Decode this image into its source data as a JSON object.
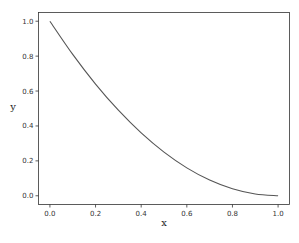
{
  "chart_data": {
    "type": "line",
    "title": "",
    "xlabel": "x",
    "ylabel": "y",
    "xlim": [
      -0.05,
      1.05
    ],
    "ylim": [
      -0.05,
      1.05
    ],
    "xticks": [
      "0.0",
      "0.2",
      "0.4",
      "0.6",
      "0.8",
      "1.0"
    ],
    "yticks": [
      "0.0",
      "0.2",
      "0.4",
      "0.6",
      "0.8",
      "1.0"
    ],
    "grid": false,
    "legend": null,
    "series": [
      {
        "name": "y",
        "color": "#555555",
        "x": [
          0.0,
          0.1,
          0.2,
          0.3,
          0.4,
          0.5,
          0.6,
          0.7,
          0.8,
          0.9,
          1.0
        ],
        "y": [
          1.0,
          0.81,
          0.64,
          0.49,
          0.36,
          0.25,
          0.16,
          0.09,
          0.04,
          0.01,
          0.0
        ]
      }
    ]
  }
}
